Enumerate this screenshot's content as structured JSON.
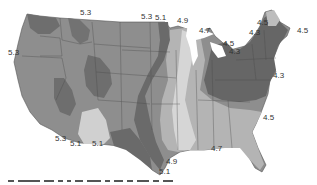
{
  "map": {
    "region": "Contiguous United States",
    "style": "grayscale shaded contour zones",
    "colors": {
      "background": "#ffffff",
      "darkest_zone": "#5f5f5f",
      "dark_zone": "#777777",
      "mid_zone": "#8e8e8e",
      "light_zone": "#b4b4b4",
      "lightest_zone": "#d6d6d6",
      "state_border": "#4a4a4a",
      "label_text": "#333333"
    },
    "contour_labels": [
      {
        "text": "5.3",
        "x": 8,
        "y": 49
      },
      {
        "text": "5.3",
        "x": 80,
        "y": 9
      },
      {
        "text": "5.3",
        "x": 141,
        "y": 13
      },
      {
        "text": "5.1",
        "x": 155,
        "y": 14
      },
      {
        "text": "4.9",
        "x": 177,
        "y": 17
      },
      {
        "text": "4.7",
        "x": 199,
        "y": 27
      },
      {
        "text": "4.3",
        "x": 249,
        "y": 29
      },
      {
        "text": "4.5",
        "x": 257,
        "y": 19
      },
      {
        "text": "4.5",
        "x": 297,
        "y": 27
      },
      {
        "text": "4.5",
        "x": 223,
        "y": 40
      },
      {
        "text": "4.3",
        "x": 229,
        "y": 48
      },
      {
        "text": "4.3",
        "x": 273,
        "y": 72
      },
      {
        "text": "4.5",
        "x": 263,
        "y": 114
      },
      {
        "text": "4.7",
        "x": 211,
        "y": 145
      },
      {
        "text": "4.9",
        "x": 166,
        "y": 158
      },
      {
        "text": "5.1",
        "x": 159,
        "y": 168
      },
      {
        "text": "5.3",
        "x": 55,
        "y": 135
      },
      {
        "text": "5.1",
        "x": 70,
        "y": 140
      },
      {
        "text": "5.1",
        "x": 92,
        "y": 140
      }
    ]
  }
}
